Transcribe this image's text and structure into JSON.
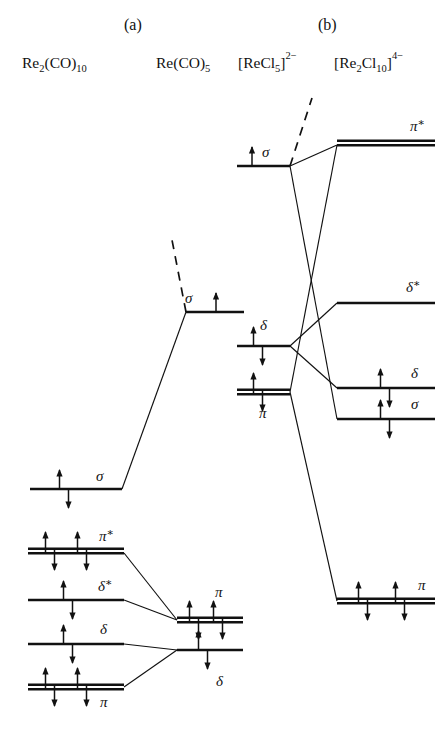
{
  "figure": {
    "panels": [
      {
        "id": "a",
        "label": "(a)",
        "x": 124,
        "y": 30
      },
      {
        "id": "b",
        "label": "(b)",
        "x": 318,
        "y": 30
      }
    ],
    "column_headings": [
      {
        "id": "re2co10",
        "text": "Re2(CO)10",
        "base": "Re",
        "sub1": "2",
        "mid": "(CO)",
        "sub2": "10",
        "x": 22,
        "y": 68
      },
      {
        "id": "reco5",
        "text": "Re(CO)5",
        "base": "Re(CO)",
        "sub2": "5",
        "x": 156,
        "y": 68
      },
      {
        "id": "recl5",
        "text": "[ReCl5]2-",
        "base": "[ReCl",
        "sub1": "5",
        "mid": "]",
        "sup": "2−",
        "x": 238,
        "y": 68
      },
      {
        "id": "re2cl10",
        "text": "[Re2Cl10]4-",
        "base": "[Re",
        "sub1": "2",
        "mid": "Cl",
        "sub2": "10",
        "tail": "]",
        "sup": "4−",
        "x": 334,
        "y": 68
      }
    ],
    "panel_a": {
      "levels": [
        {
          "id": "a-sigma-bonding",
          "label": "σ",
          "starred": false,
          "column": "left",
          "x1": 30,
          "x2": 122,
          "y": 489,
          "double": false,
          "electrons": [
            {
              "cx": 64,
              "type": "pair"
            }
          ],
          "label_x": 96,
          "label_y": 481
        },
        {
          "id": "a-sigma-fragment",
          "label": "σ",
          "starred": false,
          "column": "middle",
          "x1": 186,
          "x2": 244,
          "y": 312,
          "double": false,
          "electrons": [
            {
              "cx": 216,
              "type": "up"
            }
          ],
          "label_x": 185,
          "label_y": 303
        },
        {
          "id": "a-pi-star",
          "label": "π",
          "starred": true,
          "column": "left",
          "x1": 28,
          "x2": 124,
          "y": 551,
          "double": true,
          "electrons": [
            {
              "cx": 50,
              "type": "pair"
            },
            {
              "cx": 82,
              "type": "pair"
            }
          ],
          "label_x": 99,
          "label_y": 541
        },
        {
          "id": "a-delta-star",
          "label": "δ",
          "starred": true,
          "column": "left",
          "x1": 28,
          "x2": 124,
          "y": 600,
          "double": false,
          "electrons": [
            {
              "cx": 68,
              "type": "pair"
            }
          ],
          "label_x": 98,
          "label_y": 591
        },
        {
          "id": "a-delta-bonding",
          "label": "δ",
          "starred": false,
          "column": "left",
          "x1": 28,
          "x2": 124,
          "y": 644,
          "double": false,
          "electrons": [
            {
              "cx": 68,
              "type": "pair"
            }
          ],
          "label_x": 100,
          "label_y": 634
        },
        {
          "id": "a-pi-bonding",
          "label": "π",
          "starred": false,
          "column": "left",
          "x1": 28,
          "x2": 124,
          "y": 687,
          "double": true,
          "electrons": [
            {
              "cx": 50,
              "type": "pair"
            },
            {
              "cx": 82,
              "type": "pair"
            }
          ],
          "label_x": 100,
          "label_y": 707
        },
        {
          "id": "a-pi-fragment",
          "label": "π",
          "starred": false,
          "column": "right",
          "x1": 177,
          "x2": 243,
          "y": 620,
          "double": true,
          "electrons": [
            {
              "cx": 194,
              "type": "pair"
            },
            {
              "cx": 218,
              "type": "pair"
            }
          ],
          "label_x": 215,
          "label_y": 597
        },
        {
          "id": "a-delta-fragment",
          "label": "δ",
          "starred": false,
          "column": "right",
          "x1": 177,
          "x2": 243,
          "y": 650,
          "double": false,
          "electrons": [
            {
              "cx": 203,
              "type": "pair"
            }
          ],
          "label_x": 216,
          "label_y": 686
        }
      ],
      "correlations": [
        {
          "id": "a-corr-sigma",
          "from": [
            122,
            489
          ],
          "to": [
            186,
            312
          ]
        },
        {
          "id": "a-corr-pistar",
          "from": [
            124,
            553
          ],
          "to": [
            177,
            620
          ]
        },
        {
          "id": "a-corr-deltastar",
          "from": [
            124,
            600
          ],
          "to": [
            177,
            620
          ]
        },
        {
          "id": "a-corr-delta",
          "from": [
            124,
            644
          ],
          "to": [
            177,
            650
          ]
        },
        {
          "id": "a-corr-pi",
          "from": [
            124,
            687
          ],
          "to": [
            177,
            650
          ]
        }
      ],
      "dashes": [
        {
          "id": "a-dash-sigmastar",
          "from": [
            186,
            312
          ],
          "to": [
            172,
            240
          ]
        }
      ]
    },
    "panel_b": {
      "levels": [
        {
          "id": "b-sigma-fragment",
          "label": "σ",
          "starred": false,
          "column": "left",
          "x1": 237,
          "x2": 290,
          "y": 166,
          "double": false,
          "electrons": [
            {
              "cx": 252,
              "type": "up"
            }
          ],
          "label_x": 262,
          "label_y": 157
        },
        {
          "id": "b-delta-fragment",
          "label": "δ",
          "starred": false,
          "column": "left",
          "x1": 237,
          "x2": 290,
          "y": 346,
          "double": false,
          "electrons": [
            {
              "cx": 258,
              "type": "pair"
            }
          ],
          "label_x": 260,
          "label_y": 330
        },
        {
          "id": "b-pi-fragment",
          "label": "π",
          "starred": false,
          "column": "left",
          "x1": 237,
          "x2": 290,
          "y": 392,
          "double": true,
          "electrons": [
            {
              "cx": 258,
              "type": "pair"
            }
          ],
          "label_x": 259,
          "label_y": 418
        },
        {
          "id": "b-pi-star",
          "label": "π",
          "starred": true,
          "column": "right",
          "x1": 337,
          "x2": 435,
          "y": 143,
          "double": true,
          "electrons": [],
          "label_x": 410,
          "label_y": 131
        },
        {
          "id": "b-delta-star",
          "label": "δ",
          "starred": true,
          "column": "right",
          "x1": 337,
          "x2": 435,
          "y": 303,
          "double": false,
          "electrons": [],
          "label_x": 406,
          "label_y": 292
        },
        {
          "id": "b-delta-bonding",
          "label": "δ",
          "starred": false,
          "column": "right",
          "x1": 337,
          "x2": 435,
          "y": 388,
          "double": false,
          "electrons": [
            {
              "cx": 385,
              "type": "pair"
            }
          ],
          "label_x": 411,
          "label_y": 378
        },
        {
          "id": "b-sigma-bonding",
          "label": "σ",
          "starred": false,
          "column": "right",
          "x1": 337,
          "x2": 435,
          "y": 419,
          "double": false,
          "electrons": [
            {
              "cx": 385,
              "type": "pair"
            }
          ],
          "label_x": 411,
          "label_y": 409
        },
        {
          "id": "b-pi-bonding",
          "label": "π",
          "starred": false,
          "column": "right",
          "x1": 337,
          "x2": 435,
          "y": 601,
          "double": true,
          "electrons": [
            {
              "cx": 363,
              "type": "pair"
            },
            {
              "cx": 400,
              "type": "pair"
            }
          ],
          "label_x": 418,
          "label_y": 590
        }
      ],
      "correlations": [
        {
          "id": "b-corr-sigma-to-sigma",
          "from": [
            290,
            166
          ],
          "to": [
            337,
            419
          ]
        },
        {
          "id": "b-corr-sigma-to-pistar",
          "from": [
            290,
            166
          ],
          "to": [
            337,
            145
          ]
        },
        {
          "id": "b-corr-delta-to-deltastar",
          "from": [
            290,
            346
          ],
          "to": [
            337,
            303
          ]
        },
        {
          "id": "b-corr-delta-to-delta",
          "from": [
            290,
            346
          ],
          "to": [
            337,
            388
          ]
        },
        {
          "id": "b-corr-pi-to-pistar",
          "from": [
            290,
            392
          ],
          "to": [
            337,
            145
          ]
        },
        {
          "id": "b-corr-pi-to-pi",
          "from": [
            290,
            392
          ],
          "to": [
            337,
            601
          ]
        }
      ],
      "dashes": [
        {
          "id": "b-dash-sigmastar",
          "from": [
            290,
            166
          ],
          "to": [
            312,
            98
          ]
        }
      ]
    },
    "style": {
      "ink": "#111111",
      "background": "#ffffff",
      "level_stroke_width": 2.6,
      "double_gap": 4.5
    }
  }
}
